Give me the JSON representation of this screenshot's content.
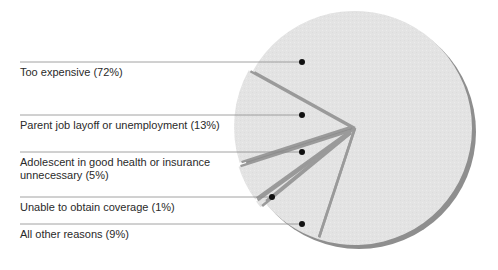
{
  "chart_data": {
    "type": "pie",
    "title": "",
    "slices": [
      {
        "label": "Too expensive (72%)",
        "category": "Too expensive",
        "value": 72
      },
      {
        "label": "Parent job layoff or unemployment  (13%)",
        "category": "Parent job layoff or unemployment",
        "value": 13
      },
      {
        "label": "Adolescent in good health or insurance\nunnecessary (5%)",
        "category": "Adolescent in good health or insurance unnecessary",
        "value": 5
      },
      {
        "label": "Unable to obtain coverage (1%)",
        "category": "Unable to obtain coverage",
        "value": 1
      },
      {
        "label": "All other reasons (9%)",
        "category": "All other reasons",
        "value": 9
      }
    ],
    "legend_position": "left (leader lines)",
    "colors": {
      "fill": "#e4e4e4",
      "divider": "#9a9a9a",
      "shadow": "#8e8e8e",
      "leader": "#8a8a8a",
      "dot": "#111111",
      "text": "#2a2a2a"
    }
  }
}
